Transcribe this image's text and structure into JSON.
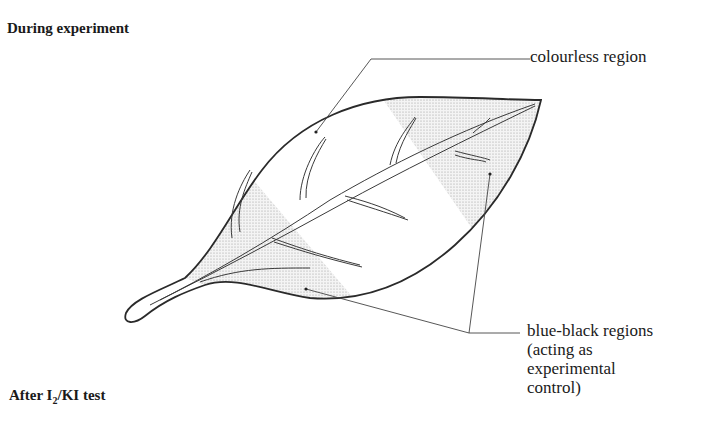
{
  "headings": {
    "top": "During experiment",
    "bottom_prefix": "After I",
    "bottom_sub": "2",
    "bottom_suffix": "/KI test"
  },
  "labels": {
    "colourless": "colourless region",
    "blue_black_line1": "blue-black regions",
    "blue_black_line2": "(acting as",
    "blue_black_line3": "experimental",
    "blue_black_line4": "control)"
  },
  "colors": {
    "outline": "#2a2a2a",
    "stipple": "#d4d4d4",
    "leader": "#444444"
  }
}
